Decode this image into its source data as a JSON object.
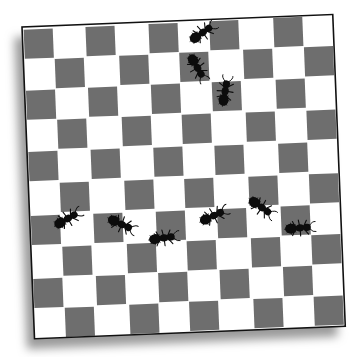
{
  "image": {
    "description": "Illustration of black ants walking on a slightly rotated 10x10 gray-and-white checkerboard with a drop shadow",
    "width": 355,
    "height": 357
  },
  "board": {
    "rows": 10,
    "cols": 10,
    "origin": [
      22,
      27
    ],
    "width": 311,
    "height": 312,
    "rotation_deg": -2.3,
    "top_left_color": "dark",
    "colors": {
      "dark": "#6e6e6e",
      "light": "#ffffff",
      "border": "#111111",
      "shadow": "#9a9a9a",
      "background": "#ffffff"
    }
  },
  "ants": [
    {
      "id": "ant-1",
      "x": 202,
      "y": 33,
      "angle": -35,
      "scale": 1.0
    },
    {
      "id": "ant-2",
      "x": 197,
      "y": 67,
      "angle": 60,
      "scale": 1.0
    },
    {
      "id": "ant-3",
      "x": 225,
      "y": 92,
      "angle": -80,
      "scale": 1.0
    },
    {
      "id": "ant-4",
      "x": 67,
      "y": 219,
      "angle": -30,
      "scale": 1.0
    },
    {
      "id": "ant-5",
      "x": 121,
      "y": 224,
      "angle": 25,
      "scale": 1.0
    },
    {
      "id": "ant-6",
      "x": 163,
      "y": 238,
      "angle": -8,
      "scale": 1.0
    },
    {
      "id": "ant-7",
      "x": 213,
      "y": 216,
      "angle": -25,
      "scale": 1.0
    },
    {
      "id": "ant-8",
      "x": 261,
      "y": 207,
      "angle": 35,
      "scale": 1.0
    },
    {
      "id": "ant-9",
      "x": 299,
      "y": 228,
      "angle": -5,
      "scale": 1.0
    }
  ],
  "ant_color": "#0c0c0c"
}
